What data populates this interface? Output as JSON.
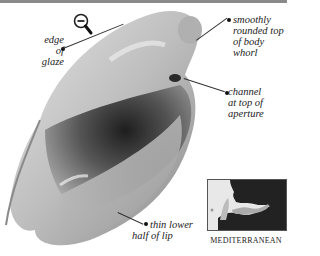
{
  "icon": {
    "name": "zoom-out-magnifier-icon",
    "glyph": "−"
  },
  "labels": {
    "edge_of_glaze": [
      "edge of",
      "glaze"
    ],
    "smoothly_rounded": [
      "smoothly",
      "rounded top",
      "of body",
      "whorl"
    ],
    "channel": [
      "channel",
      "at top of",
      "aperture"
    ],
    "thin_lower": [
      "thin lower",
      "half of lip"
    ]
  },
  "map": {
    "caption": "MEDITERRANEAN",
    "land_color": "#222222",
    "sea_color": "#d8d8d8",
    "highlight_color": "#aaaaaa"
  },
  "colors": {
    "background": "#ffffff",
    "shell_light": "#d6d6d6",
    "shell_mid": "#a8a8a8",
    "shell_dark": "#3a3a3a",
    "text": "#222222",
    "topbar": "#8a8a8a"
  }
}
